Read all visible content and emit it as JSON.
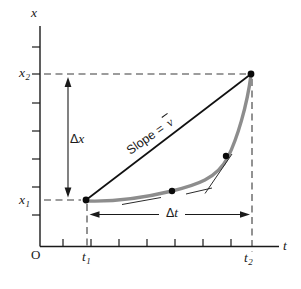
{
  "colors": {
    "background": "#ffffff",
    "axis": "#1a1a1a",
    "secant": "#111111",
    "curve": "#8d8d8d",
    "dashed": "#3a3a3a",
    "dot": "#0a0a0a"
  },
  "labels": {
    "x_axis": "x",
    "t_axis": "t",
    "origin": "O",
    "x2": {
      "base": "x",
      "sub": "2"
    },
    "x1": {
      "base": "x",
      "sub": "1"
    },
    "t1": {
      "base": "t",
      "sub": "1"
    },
    "t2": {
      "base": "t",
      "sub": "2"
    },
    "delta_x": {
      "delta": "Δ",
      "var": "x"
    },
    "delta_t": {
      "delta": "Δ",
      "var": "t"
    },
    "slope": {
      "prefix": "Slope = ",
      "v": "v"
    }
  }
}
